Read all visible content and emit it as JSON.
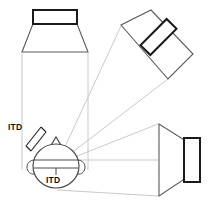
{
  "figure": {
    "background_color": "#ffffff",
    "beam_color": "#c9c9c9",
    "cone_color": "#5a5a5a",
    "magnet_color": "#1a1a1a",
    "head_color": "#4a4a4a",
    "label_color": "#111111"
  },
  "labels": {
    "itd_left": "ITD",
    "itd_bottom": "ITD"
  },
  "speakers": [
    {
      "id": "top-left-speaker",
      "name": "front-speaker",
      "orientation": "facing-down",
      "rotation_deg": 0,
      "cone_points": "22,52 88,52 74,16 36,16",
      "magnet_rect": {
        "x": 33,
        "y": 10,
        "width": 44,
        "height": 14
      }
    },
    {
      "id": "upper-right-speaker",
      "name": "diagonal-speaker",
      "orientation": "facing-lower-left",
      "rotation_deg": -45,
      "cone_points": "121,25 168,79 193,54 151,10",
      "magnet_rect": {
        "x": 150,
        "y": 14,
        "width": 17,
        "height": 46
      }
    },
    {
      "id": "right-speaker",
      "name": "side-speaker",
      "orientation": "facing-left",
      "rotation_deg": -90,
      "cone_points": "159,124 159,196 186,178 186,141",
      "magnet_rect": {
        "x": 184,
        "y": 138,
        "width": 16,
        "height": 44
      }
    }
  ],
  "head": {
    "name": "listener-head-top-view",
    "center": {
      "x": 56,
      "y": 166
    },
    "radius_x": 23,
    "radius_y": 22,
    "nose": {
      "points": "50,146 56,137 62,146"
    },
    "ear_left": {
      "cx": 33,
      "cy": 167
    },
    "ear_right": {
      "cx": 79,
      "cy": 167
    },
    "interaural_axis": {
      "x1": 34,
      "y1": 161,
      "x2": 78,
      "y2": 161
    },
    "interaural_axis_lower": {
      "x1": 34,
      "y1": 168,
      "x2": 78,
      "y2": 168
    },
    "tick": {
      "x": 56,
      "y1": 168,
      "y2": 174
    }
  },
  "beams": [
    {
      "name": "front-speaker-beam-left",
      "x1": 22,
      "y1": 53,
      "x2": 22,
      "y2": 170
    },
    {
      "name": "front-speaker-beam-right",
      "x1": 88,
      "y1": 53,
      "x2": 88,
      "y2": 170
    },
    {
      "name": "diagonal-speaker-beam-upper",
      "x1": 121,
      "y1": 26,
      "x2": 57,
      "y2": 164
    },
    {
      "name": "diagonal-speaker-beam-lower",
      "x1": 168,
      "y1": 79,
      "x2": 57,
      "y2": 164
    },
    {
      "name": "side-speaker-beam-top",
      "x1": 158,
      "y1": 124,
      "x2": 57,
      "y2": 164
    },
    {
      "name": "side-speaker-beam-mid",
      "x1": 158,
      "y1": 160,
      "x2": 57,
      "y2": 160
    },
    {
      "name": "side-speaker-beam-bottom",
      "x1": 158,
      "y1": 196,
      "x2": 57,
      "y2": 196
    }
  ],
  "itd_caliper": {
    "name": "itd-diagonal-caliper",
    "path": "M 27,146 L 31,150 M 27,146 L 42,127 M 42,127 L 46,131 M 31,150 L 46,131",
    "rotation_deg": -52
  }
}
